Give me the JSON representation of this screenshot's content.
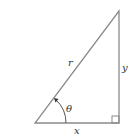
{
  "diagram": {
    "type": "right-triangle",
    "labels": {
      "hypotenuse": "r",
      "vertical_leg": "y",
      "horizontal_leg": "x",
      "angle": "θ"
    },
    "colors": {
      "stroke": "#8a8a8a",
      "text": "#333333",
      "background": "#ffffff"
    }
  }
}
